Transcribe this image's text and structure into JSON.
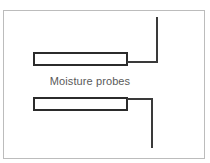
{
  "figure": {
    "title": "Moisture probes",
    "background_color": "#ffffff",
    "frame": {
      "name": "figure-border",
      "color": "#bcbcbc",
      "stroke_width": 1,
      "x": 3,
      "y": 10,
      "width": 202,
      "height": 149
    },
    "label": {
      "text": "Moisture probes",
      "color": "#5a5a5a",
      "font_size": 11,
      "x": 90,
      "y": 81
    },
    "line_color": "#3a3a3a",
    "outline_color": "#2b2b2b",
    "fill_color": "#ffffff",
    "components": [
      {
        "name": "moisture-probe-upper",
        "type": "probe",
        "x": 33,
        "y": 52,
        "width": 95,
        "height": 14,
        "stroke_width": 2,
        "lead": {
          "name": "probe-lead-upper",
          "direction": "right-then-up",
          "horizontal": {
            "x": 127,
            "y": 61,
            "length": 31
          },
          "vertical": {
            "x": 156,
            "y": 17,
            "length": 46
          },
          "stroke_width": 2
        }
      },
      {
        "name": "moisture-probe-lower",
        "type": "probe",
        "x": 33,
        "y": 97,
        "width": 95,
        "height": 14,
        "stroke_width": 2,
        "lead": {
          "name": "probe-lead-lower",
          "direction": "right-then-down",
          "horizontal": {
            "x": 127,
            "y": 98,
            "length": 26
          },
          "vertical": {
            "x": 151,
            "y": 98,
            "length": 50
          },
          "stroke_width": 2
        }
      }
    ]
  }
}
